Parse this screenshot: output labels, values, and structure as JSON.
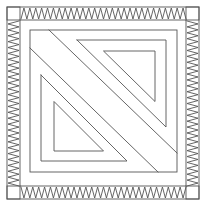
{
  "figure": {
    "title": "Quilt block line drawing",
    "width": 206,
    "height": 206,
    "background": "#ffffff",
    "stroke_color": "#555555",
    "stroke_width": 0.9,
    "outer_square": {
      "x1": 7,
      "y1": 7,
      "x2": 199,
      "y2": 199
    },
    "band_inner_square": {
      "x1": 20,
      "y1": 20,
      "x2": 186,
      "y2": 186
    },
    "zigzag_bands": [
      {
        "name": "top-band",
        "orientation": "horizontal",
        "start": 21,
        "end": 186,
        "edge_a": 8,
        "edge_b": 19,
        "teeth": 28
      },
      {
        "name": "right-band",
        "orientation": "vertical",
        "start": 21,
        "end": 186,
        "edge_a": 198,
        "edge_b": 187,
        "teeth": 28
      },
      {
        "name": "bottom-band",
        "orientation": "horizontal",
        "start": 21,
        "end": 186,
        "edge_a": 198,
        "edge_b": 187,
        "teeth": 28
      },
      {
        "name": "left-band",
        "orientation": "vertical",
        "start": 21,
        "end": 186,
        "edge_a": 8,
        "edge_b": 19,
        "teeth": 28
      }
    ],
    "corner_boxes": [
      {
        "name": "corner-top-left",
        "x1": 7,
        "y1": 7,
        "x2": 20,
        "y2": 20
      },
      {
        "name": "corner-top-right",
        "x1": 186,
        "y1": 7,
        "x2": 199,
        "y2": 20
      },
      {
        "name": "corner-bottom-right",
        "x1": 186,
        "y1": 186,
        "x2": 199,
        "y2": 199
      },
      {
        "name": "corner-bottom-left",
        "x1": 7,
        "y1": 186,
        "x2": 20,
        "y2": 199
      }
    ],
    "inner_frame": {
      "x1": 30,
      "y1": 30,
      "x2": 177,
      "y2": 172
    },
    "diagonals": [
      {
        "name": "diagonal-upper",
        "points": [
          [
            49,
            30
          ],
          [
            177,
            153
          ]
        ]
      },
      {
        "name": "diagonal-lower",
        "points": [
          [
            30,
            48
          ],
          [
            158,
            172
          ]
        ]
      }
    ],
    "nested_shapes": [
      {
        "name": "upper-right-l-shape",
        "points": [
          [
            77,
            40
          ],
          [
            166,
            40
          ],
          [
            166,
            127
          ],
          [
            77,
            40
          ]
        ],
        "closed": false
      },
      {
        "name": "upper-right-triangle",
        "points": [
          [
            104,
            51
          ],
          [
            155,
            51
          ],
          [
            155,
            101
          ]
        ],
        "closed": true
      },
      {
        "name": "lower-left-l-shape",
        "points": [
          [
            41,
            75
          ],
          [
            41,
            161
          ],
          [
            127,
            161
          ],
          [
            41,
            75
          ]
        ],
        "closed": false
      },
      {
        "name": "lower-left-triangle",
        "points": [
          [
            54,
            102
          ],
          [
            54,
            151
          ],
          [
            103,
            151
          ]
        ],
        "closed": true
      }
    ]
  }
}
